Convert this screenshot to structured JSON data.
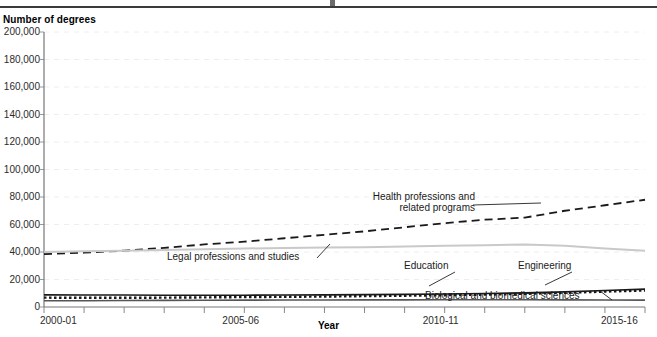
{
  "header": {
    "y_axis_title": "Number of degrees",
    "x_axis_title": "Year"
  },
  "chart_data": {
    "type": "line",
    "title": "",
    "xlabel": "Year",
    "ylabel": "Number of degrees",
    "ylim": [
      0,
      200000
    ],
    "ytick_labels": [
      "200,000",
      "180,000",
      "160,000",
      "140,000",
      "120,000",
      "100,000",
      "80,000",
      "60,000",
      "40,000",
      "20,000",
      "0"
    ],
    "ytick_values": [
      200000,
      180000,
      160000,
      140000,
      120000,
      100000,
      80000,
      60000,
      40000,
      20000,
      0
    ],
    "grid": true,
    "legend": "annotations-on-plot",
    "x": [
      "2000-01",
      "2001-02",
      "2002-03",
      "2003-04",
      "2004-05",
      "2005-06",
      "2006-07",
      "2007-08",
      "2008-09",
      "2009-10",
      "2010-11",
      "2011-12",
      "2012-13",
      "2013-14",
      "2014-15",
      "2015-16"
    ],
    "xtick_labels_shown": [
      "2000-01",
      "2005-06",
      "2010-11",
      "2015-16"
    ],
    "series": [
      {
        "name": "Health professions and related programs",
        "style": "dashed",
        "color": "#1a1a1a",
        "values": [
          38500,
          39500,
          41000,
          43000,
          45500,
          47500,
          50000,
          52500,
          55000,
          58000,
          61000,
          63500,
          65000,
          70000,
          74000,
          78000
        ]
      },
      {
        "name": "Education",
        "style": "solid",
        "color": "#c9c9c9",
        "values": [
          40000,
          40500,
          41000,
          41500,
          42000,
          42500,
          43000,
          43200,
          43500,
          44000,
          44500,
          45000,
          45500,
          44500,
          42500,
          41000
        ]
      },
      {
        "name": "Engineering",
        "style": "solid",
        "color": "#1a1a1a",
        "values": [
          8800,
          8700,
          8700,
          8600,
          8600,
          8600,
          8700,
          8800,
          9000,
          9200,
          9500,
          9800,
          10300,
          11000,
          12000,
          13000
        ]
      },
      {
        "name": "Biological and biomedical sciences",
        "style": "dotted",
        "color": "#1a1a1a",
        "values": [
          6800,
          6700,
          6700,
          6800,
          7000,
          7200,
          7400,
          7600,
          7900,
          8200,
          8600,
          9000,
          9600,
          10300,
          11200,
          12000
        ]
      },
      {
        "name": "Legal professions and studies",
        "style": "solid",
        "color": "#555555",
        "values": [
          4500,
          4600,
          4700,
          4800,
          4900,
          5000,
          5100,
          5100,
          5200,
          5200,
          5300,
          5300,
          5300,
          5200,
          5100,
          5000
        ]
      }
    ],
    "annotations": [
      {
        "text_line1": "Health professions and",
        "text_line2": "related programs"
      },
      {
        "text_line1": "Legal professions and studies"
      },
      {
        "text_line1": "Education"
      },
      {
        "text_line1": "Engineering"
      },
      {
        "text_line1": "Biological and biomedical sciences"
      }
    ]
  }
}
